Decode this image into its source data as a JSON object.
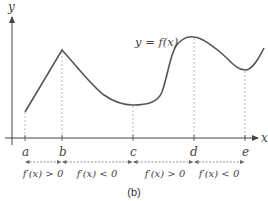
{
  "diagram": {
    "caption": "(b)",
    "axes": {
      "x_label": "x",
      "y_label": "y"
    },
    "curve_label": "y = f(x)",
    "points": [
      {
        "label": "a",
        "x": 25
      },
      {
        "label": "b",
        "x": 62
      },
      {
        "label": "c",
        "x": 133
      },
      {
        "label": "d",
        "x": 193
      },
      {
        "label": "e",
        "x": 245
      }
    ],
    "intervals": [
      {
        "label": "f′(x) > 0",
        "from": "a",
        "to": "b"
      },
      {
        "label": "f′(x) < 0",
        "from": "b",
        "to": "c"
      },
      {
        "label": "f′(x) > 0",
        "from": "c",
        "to": "d"
      },
      {
        "label": "f′(x) < 0",
        "from": "d",
        "to": "e"
      }
    ],
    "colors": {
      "curve": "#555555",
      "axis": "#444444",
      "guide": "#aaaaaa"
    }
  }
}
